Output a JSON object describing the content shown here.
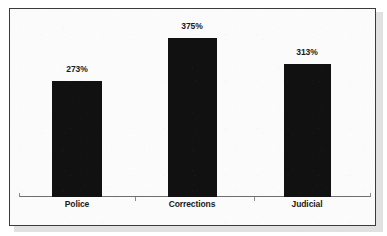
{
  "chart_data": {
    "type": "bar",
    "title": "",
    "subtitle": "",
    "xlabel": "",
    "ylabel": "",
    "categories": [
      "Police",
      "Corrections",
      "Judicial"
    ],
    "values": [
      273,
      375,
      313
    ],
    "value_labels": [
      "273%",
      "375%",
      "313%"
    ],
    "value_unit": "%",
    "ylim": [
      0,
      375
    ],
    "grid": false,
    "legend": null,
    "series": [
      {
        "name": "",
        "values": [
          273,
          375,
          313
        ]
      }
    ],
    "annotations": [],
    "axis": {
      "x_axis_visible": true,
      "y_axis_visible": false,
      "tick_labels_y": []
    }
  },
  "style": {
    "bar_color": "#111111",
    "background_color": "#fbfbfb",
    "border_color": "#3b3b3b",
    "axis_color": "#6e6e6e",
    "text_color": "#1a1a1a"
  },
  "bars": [
    {
      "label": "Police",
      "value_label": "273%",
      "left": 52,
      "width": 50,
      "height": 116,
      "label_center": 77,
      "value_top": 64
    },
    {
      "label": "Corrections",
      "value_label": "375%",
      "left": 168,
      "width": 49,
      "height": 159,
      "label_center": 192,
      "value_top": 21
    },
    {
      "label": "Judicial",
      "value_label": "313%",
      "left": 284,
      "width": 47,
      "height": 133,
      "label_center": 307,
      "value_top": 47
    }
  ]
}
